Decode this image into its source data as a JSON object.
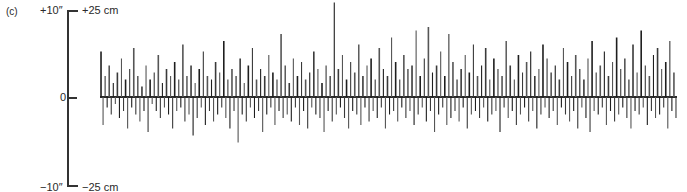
{
  "panel_label": "(c)",
  "axis": {
    "top_inches": "+10″",
    "top_cm": "+25 cm",
    "zero": "0",
    "bottom_inches": "−10″",
    "bottom_cm": "−25 cm"
  },
  "colors": {
    "ink": "#2a2a2a",
    "background": "#ffffff"
  },
  "chart_data": {
    "type": "bar",
    "title": "",
    "xlabel": "",
    "ylabel": "Deviation (cm / inches)",
    "ylim_cm": [
      -25,
      25
    ],
    "ylim_in": [
      -10,
      10
    ],
    "grid": false,
    "legend": null,
    "x_start_px": 100,
    "x_end_px": 677,
    "zero_px": 97,
    "px_per_cm": 3.5,
    "values": [
      13,
      -8,
      6,
      -3,
      9,
      -5,
      4,
      -2,
      7,
      -6,
      11,
      -4,
      5,
      -9,
      8,
      -3,
      14,
      -5,
      6,
      -7,
      3,
      -4,
      9,
      -10,
      5,
      -2,
      7,
      -4,
      12,
      -6,
      4,
      -3,
      8,
      -5,
      6,
      -9,
      10,
      -4,
      5,
      -3,
      15,
      -7,
      6,
      -5,
      9,
      -11,
      4,
      -6,
      8,
      -3,
      13,
      -8,
      6,
      -4,
      5,
      -7,
      10,
      -5,
      7,
      -3,
      16,
      -6,
      5,
      -9,
      8,
      -4,
      6,
      -13,
      11,
      -5,
      4,
      -7,
      9,
      -3,
      14,
      -6,
      5,
      -4,
      8,
      -10,
      6,
      -5,
      12,
      -3,
      7,
      -8,
      5,
      -4,
      18,
      -6,
      9,
      -5,
      4,
      -7,
      11,
      -3,
      6,
      -8,
      10,
      -4,
      5,
      -9,
      7,
      -3,
      13,
      -5,
      8,
      -6,
      4,
      -10,
      9,
      -4,
      6,
      -7,
      27,
      -5,
      8,
      -3,
      12,
      -6,
      5,
      -9,
      10,
      -4,
      7,
      -5,
      15,
      -8,
      6,
      -3,
      9,
      -7,
      11,
      -4,
      5,
      -6,
      14,
      -3,
      8,
      -9,
      6,
      -5,
      17,
      -4,
      10,
      -7,
      5,
      -3,
      12,
      -6,
      8,
      -4,
      9,
      -8,
      19,
      -5,
      6,
      -3,
      11,
      -7,
      20,
      -4,
      7,
      -10,
      9,
      -5,
      13,
      -3,
      6,
      -8,
      18,
      -6,
      10,
      -4,
      5,
      -7,
      8,
      -3,
      12,
      -9,
      7,
      -5,
      15,
      -4,
      6,
      -6,
      9,
      -3,
      14,
      -7,
      5,
      -5,
      11,
      -4,
      8,
      -10,
      6,
      -3,
      16,
      -6,
      9,
      -4,
      5,
      -8,
      12,
      -5,
      7,
      -3,
      10,
      -7,
      13,
      -4,
      6,
      -9,
      8,
      -5,
      15,
      -3,
      11,
      -6,
      7,
      -4,
      9,
      -8,
      5,
      -3,
      14,
      -5,
      10,
      -7,
      6,
      -4,
      12,
      -9,
      8,
      -3,
      5,
      -6,
      11,
      -10,
      16,
      -4,
      7,
      -5,
      9,
      -3,
      13,
      -8,
      6,
      -4,
      10,
      -7,
      17,
      -5,
      8,
      -3,
      11,
      -6,
      5,
      -9,
      15,
      -4,
      7,
      -5,
      19,
      -3,
      9,
      -8,
      6,
      -4,
      12,
      -6,
      14,
      -5,
      8,
      -3,
      10,
      -9,
      16,
      -4,
      7,
      -6
    ]
  }
}
